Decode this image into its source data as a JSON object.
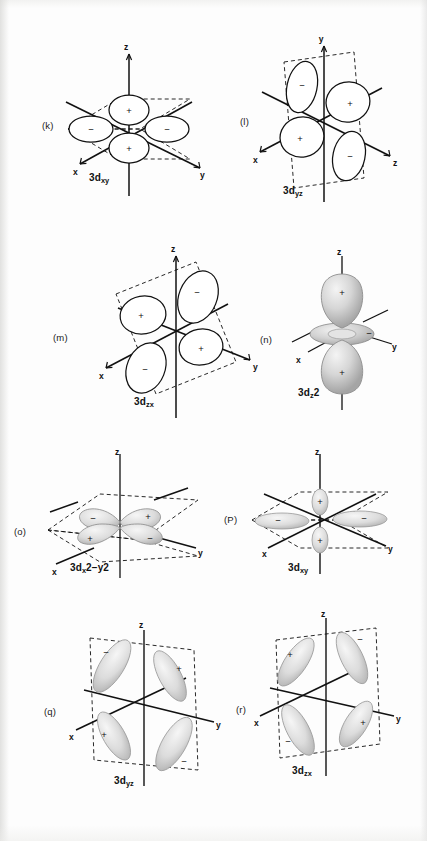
{
  "figure": {
    "kind": "orbital-diagram-plate",
    "background_color": "#fdfdfd",
    "ink_color": "#111111",
    "shade_color": "#b9b9b9",
    "panel_count": 8
  },
  "axis_labels": {
    "x": "x",
    "y": "y",
    "z": "z"
  },
  "signs": {
    "positive": "+",
    "negative": "−"
  },
  "panels": [
    {
      "id": "k",
      "letter": "(k)",
      "orbital_base": "3d",
      "orbital_sub": "xy",
      "orbital_sup": "",
      "label_text": "3dxy",
      "style": "line-art",
      "vertical_axis": "z",
      "left_axis": "x",
      "right_axis": "y",
      "plane": "horizontal",
      "lobe_signs": [
        "+",
        "−",
        "−",
        "+"
      ]
    },
    {
      "id": "l",
      "letter": "(l)",
      "orbital_base": "3d",
      "orbital_sub": "yz",
      "orbital_sup": "",
      "label_text": "3dyz",
      "style": "line-art",
      "vertical_axis": "y",
      "left_axis": "x",
      "right_axis": "z",
      "plane": "vertical",
      "lobe_signs": [
        "−",
        "+",
        "+",
        "−"
      ]
    },
    {
      "id": "m",
      "letter": "(m)",
      "orbital_base": "3d",
      "orbital_sub": "zx",
      "orbital_sup": "",
      "label_text": "3dzx",
      "style": "line-art",
      "vertical_axis": "z",
      "left_axis": "x",
      "right_axis": "y",
      "plane": "vertical",
      "lobe_signs": [
        "−",
        "+",
        "+",
        "−"
      ]
    },
    {
      "id": "n",
      "letter": "(n)",
      "orbital_base": "3d",
      "orbital_sub": "z",
      "orbital_sup": "2",
      "label_text": "3dz2",
      "style": "shaded",
      "vertical_axis": "z",
      "left_axis": "x",
      "right_axis": "y",
      "plane": "axial-with-torus",
      "lobe_signs": [
        "+",
        "−",
        "+"
      ]
    },
    {
      "id": "o",
      "letter": "(o)",
      "orbital_base": "3d",
      "orbital_sub": "x",
      "orbital_sup": "2−y2",
      "label_text": "3dx2−y2",
      "style": "shaded",
      "vertical_axis": "z",
      "left_axis": "x",
      "right_axis": "y",
      "plane": "horizontal",
      "lobe_signs": [
        "−",
        "+",
        "+",
        "−"
      ]
    },
    {
      "id": "p",
      "letter": "(P)",
      "orbital_base": "3d",
      "orbital_sub": "xy",
      "orbital_sup": "",
      "label_text": "3dxy",
      "style": "shaded",
      "vertical_axis": "z",
      "left_axis": "x",
      "right_axis": "y",
      "plane": "horizontal",
      "lobe_signs": [
        "+",
        "−",
        "−",
        "+"
      ]
    },
    {
      "id": "q",
      "letter": "(q)",
      "orbital_base": "3d",
      "orbital_sub": "yz",
      "orbital_sup": "",
      "label_text": "3dyz",
      "style": "shaded",
      "vertical_axis": "z",
      "left_axis": "x",
      "right_axis": "y",
      "plane": "vertical",
      "lobe_signs": [
        "−",
        "+",
        "+",
        "−"
      ]
    },
    {
      "id": "r",
      "letter": "(r)",
      "orbital_base": "3d",
      "orbital_sub": "zx",
      "orbital_sup": "",
      "label_text": "3dzx",
      "style": "shaded",
      "vertical_axis": "z",
      "left_axis": "x",
      "right_axis": "y",
      "plane": "vertical",
      "lobe_signs": [
        "+",
        "−",
        "−",
        "+"
      ]
    }
  ]
}
